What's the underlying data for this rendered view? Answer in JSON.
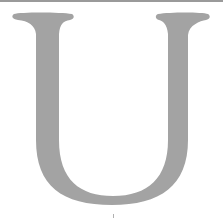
{
  "glyph": {
    "character": "U",
    "color": "#a3a3a3",
    "background": "#ffffff"
  },
  "top_rule": {
    "color": "#9a9a9a"
  }
}
